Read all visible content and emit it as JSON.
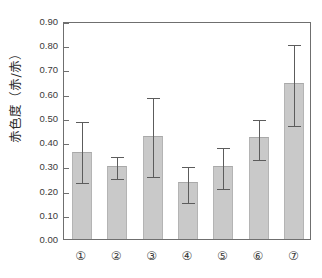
{
  "chart_data": {
    "type": "bar",
    "title": "",
    "subtitle": "",
    "xlabel": "",
    "ylabel": "赤色度（赤/赤）",
    "categories": [
      "①",
      "②",
      "③",
      "④",
      "⑤",
      "⑥",
      "⑦"
    ],
    "values": [
      0.36,
      0.3,
      0.425,
      0.235,
      0.3,
      0.42,
      0.645
    ],
    "error_upper": [
      0.49,
      0.345,
      0.59,
      0.305,
      0.385,
      0.5,
      0.81
    ],
    "error_lower": [
      0.24,
      0.255,
      0.265,
      0.155,
      0.215,
      0.335,
      0.475
    ],
    "ylim": [
      0.0,
      0.9
    ],
    "ytick_values": [
      0.0,
      0.1,
      0.2,
      0.3,
      0.4,
      0.5,
      0.6,
      0.7,
      0.8,
      0.9
    ],
    "ytick_labels": [
      "0.00",
      "0.10",
      "0.20",
      "0.30",
      "0.40",
      "0.50",
      "0.60",
      "0.70",
      "0.80",
      "0.90"
    ],
    "grid": false,
    "legend": "none",
    "series": [
      {
        "name": "赤色度",
        "values": [
          0.36,
          0.3,
          0.425,
          0.235,
          0.3,
          0.42,
          0.645
        ]
      }
    ],
    "bar_color": "#c9c9c9",
    "bar_edge_color": "#a9a9a9",
    "error_color": "#5c5c5c",
    "axis_color": "#6f6f6f",
    "background_color": "#ffffff"
  }
}
